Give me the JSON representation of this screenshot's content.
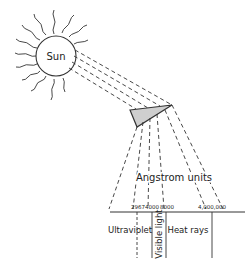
{
  "diagram": {
    "sun_label": "Sun",
    "axis_title": "Angstrom units",
    "ticks": [
      "2967",
      "4000",
      "8000",
      "4,000,000"
    ],
    "regions": {
      "ultraviolet": "Ultraviolet",
      "visible": "Visible light",
      "heat": "Heat rays"
    },
    "colors": {
      "line": "#333333",
      "prism_fill": "#cfcfcf"
    }
  }
}
